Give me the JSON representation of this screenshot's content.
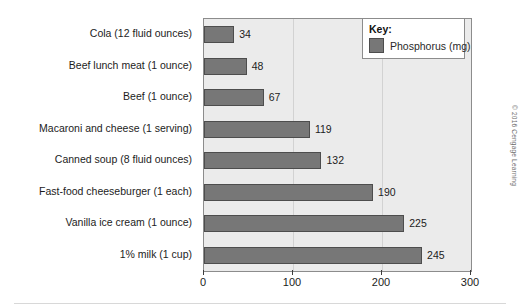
{
  "chart_data": {
    "type": "bar",
    "orientation": "horizontal",
    "title": "",
    "xlabel": "",
    "ylabel": "",
    "xlim": [
      0,
      300
    ],
    "xticks": [
      "0",
      "100",
      "200",
      "300"
    ],
    "grid": true,
    "legend_position": "top-right",
    "categories": [
      "Cola (12 fluid ounces)",
      "Beef lunch meat (1 ounce)",
      "Beef (1 ounce)",
      "Macaroni and cheese (1 serving)",
      "Canned soup (8 fluid ounces)",
      "Fast-food cheeseburger (1 each)",
      "Vanilla ice cream (1 ounce)",
      "1% milk (1 cup)"
    ],
    "values": [
      34,
      48,
      67,
      119,
      132,
      190,
      225,
      245
    ],
    "value_labels": [
      "34",
      "48",
      "67",
      "119",
      "132",
      "190",
      "225",
      "245"
    ],
    "series": [
      {
        "name": "Phosphorus (mg)",
        "values": [
          34,
          48,
          67,
          119,
          132,
          190,
          225,
          245
        ]
      }
    ]
  },
  "legend": {
    "title": "Key:",
    "entries": [
      {
        "label": "Phosphorus (mg)",
        "color": "#777777"
      }
    ]
  },
  "colors": {
    "bar_fill": "#777777",
    "bar_stroke": "#4d4d4d",
    "plot_background": "#ebebeb",
    "plot_border": "#8c8c8c",
    "gridline": "#d2d2d2",
    "text": "#1c1c1c"
  },
  "credit": "© 2016 Cengage Learning"
}
